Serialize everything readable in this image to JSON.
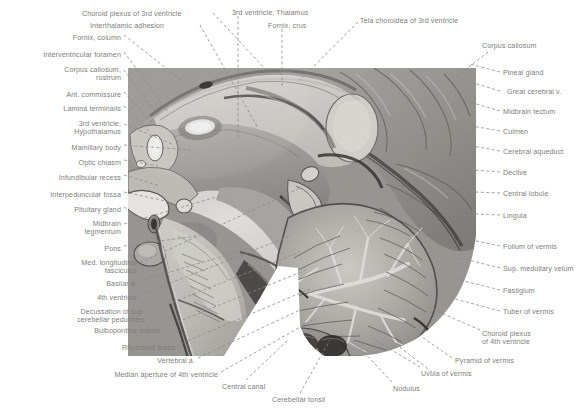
{
  "figure": {
    "text_color": "#7d7d7d",
    "leader_color": "#8a8a8a",
    "background": "#ffffff",
    "width": 587,
    "height": 411
  },
  "labels_top": [
    {
      "text": "Choroid plexus of 3rd ventricle",
      "x": 82,
      "y": 10,
      "align": "l",
      "lines": [
        "Choroid plexus of 3rd ventricle"
      ]
    },
    {
      "text": "Interthalamic adhesion",
      "x": 90,
      "y": 22,
      "align": "l",
      "lines": [
        "Interthalamic adhesion"
      ]
    },
    {
      "text": "3rd ventricle; Thalamus",
      "x": 232,
      "y": 9,
      "align": "l",
      "lines": [
        "3rd ventricle; Thalamus"
      ]
    },
    {
      "text": "Fornix, crus",
      "x": 268,
      "y": 22,
      "align": "l",
      "lines": [
        "Fornix, crus"
      ]
    },
    {
      "text": "Tela choroidea of 3rd ventricle",
      "x": 360,
      "y": 17,
      "align": "l",
      "lines": [
        "Tela choroidea of 3rd ventricle"
      ]
    }
  ],
  "labels_left": [
    {
      "text": "Fornix, column",
      "x": 121,
      "y": 34,
      "align": "r",
      "lines": [
        "Fornix, column"
      ]
    },
    {
      "text": "Interventricular foramen",
      "x": 121,
      "y": 51,
      "align": "r",
      "lines": [
        "Interventricular foramen"
      ]
    },
    {
      "text": "Corpus callosum, rostrum",
      "x": 121,
      "y": 66,
      "align": "r",
      "lines": [
        "Corpus callosum,",
        "rostrum"
      ]
    },
    {
      "text": "Ant. commissure",
      "x": 121,
      "y": 91,
      "align": "r",
      "lines": [
        "Ant. commissure"
      ]
    },
    {
      "text": "Lamina terminalis",
      "x": 121,
      "y": 105,
      "align": "r",
      "lines": [
        "Lamina terminalis"
      ]
    },
    {
      "text": "3rd ventricle; Hypothalamus",
      "x": 121,
      "y": 120,
      "align": "r",
      "lines": [
        "3rd ventricle;",
        "Hypothalamus"
      ]
    },
    {
      "text": "Mamillary body",
      "x": 121,
      "y": 144,
      "align": "r",
      "lines": [
        "Mamillary body"
      ]
    },
    {
      "text": "Optic chiasm",
      "x": 121,
      "y": 159,
      "align": "r",
      "lines": [
        "Optic chiasm"
      ]
    },
    {
      "text": "Infundibular recess",
      "x": 121,
      "y": 174,
      "align": "r",
      "lines": [
        "Infundibular recess"
      ]
    },
    {
      "text": "Interpeduncular fossa",
      "x": 121,
      "y": 191,
      "align": "r",
      "lines": [
        "Interpeduncular fossa"
      ]
    },
    {
      "text": "Pituitary gland",
      "x": 121,
      "y": 206,
      "align": "r",
      "lines": [
        "Pituitary gland"
      ]
    },
    {
      "text": "Midbrain tegmentum",
      "x": 121,
      "y": 220,
      "align": "r",
      "lines": [
        "Midbrain",
        "tegmentum"
      ]
    },
    {
      "text": "Pons",
      "x": 121,
      "y": 245,
      "align": "r",
      "lines": [
        "Pons"
      ]
    },
    {
      "text": "Med. longitudinal fasciculus",
      "x": 137,
      "y": 259,
      "align": "r",
      "lines": [
        "Med. longitudinal",
        "fasciculus"
      ]
    },
    {
      "text": "Basilar a.",
      "x": 137,
      "y": 280,
      "align": "r",
      "lines": [
        "Basilar a."
      ]
    },
    {
      "text": "4th ventricle",
      "x": 137,
      "y": 294,
      "align": "r",
      "lines": [
        "4th ventricle"
      ]
    },
    {
      "text": "Decussation of sup. cerebellar peduncles",
      "x": 145,
      "y": 308,
      "align": "r",
      "lines": [
        "Decussation of sup.",
        "cerebellar peduncles"
      ]
    },
    {
      "text": "Bulbopontine sulcus",
      "x": 160,
      "y": 327,
      "align": "r",
      "lines": [
        "Bulbopontine sulcus"
      ]
    },
    {
      "text": "Rhomboid fossa",
      "x": 175,
      "y": 344,
      "align": "r",
      "lines": [
        "Rhomboid fossa"
      ]
    },
    {
      "text": "Vertebral a.",
      "x": 195,
      "y": 357,
      "align": "r",
      "lines": [
        "Vertebral a."
      ]
    },
    {
      "text": "Median aperture of 4th ventricle",
      "x": 218,
      "y": 371,
      "align": "r",
      "lines": [
        "Median aperture of 4th ventricle"
      ]
    }
  ],
  "labels_bottom": [
    {
      "text": "Central canal",
      "x": 222,
      "y": 383,
      "align": "l",
      "lines": [
        "Central canal"
      ]
    },
    {
      "text": "Cerebellar tonsil",
      "x": 272,
      "y": 396,
      "align": "l",
      "lines": [
        "Cerebellar tonsil"
      ]
    },
    {
      "text": "Nodulus",
      "x": 393,
      "y": 385,
      "align": "l",
      "lines": [
        "Nodulus"
      ]
    },
    {
      "text": "Uvula of vermis",
      "x": 421,
      "y": 370,
      "align": "l",
      "lines": [
        "Uvula of vermis"
      ]
    }
  ],
  "labels_right": [
    {
      "text": "Corpus callosum",
      "x": 482,
      "y": 42,
      "align": "l",
      "lines": [
        "Corpus callosum"
      ]
    },
    {
      "text": "Pineal gland",
      "x": 503,
      "y": 69,
      "align": "l",
      "lines": [
        "Pineal gland"
      ]
    },
    {
      "text": "Great cerebral v.",
      "x": 507,
      "y": 88,
      "align": "l",
      "lines": [
        "Great cerebral v."
      ]
    },
    {
      "text": "Midbrain tectum",
      "x": 503,
      "y": 108,
      "align": "l",
      "lines": [
        "Midbrain tectum"
      ]
    },
    {
      "text": "Culmen",
      "x": 503,
      "y": 128,
      "align": "l",
      "lines": [
        "Culmen"
      ]
    },
    {
      "text": "Cerebral aqueduct",
      "x": 503,
      "y": 148,
      "align": "l",
      "lines": [
        "Cerebral aqueduct"
      ]
    },
    {
      "text": "Declive",
      "x": 503,
      "y": 169,
      "align": "l",
      "lines": [
        "Declive"
      ]
    },
    {
      "text": "Central lobule",
      "x": 503,
      "y": 190,
      "align": "l",
      "lines": [
        "Central lobule"
      ]
    },
    {
      "text": "Lingula",
      "x": 503,
      "y": 212,
      "align": "l",
      "lines": [
        "Lingula"
      ]
    },
    {
      "text": "Folium of vermis",
      "x": 503,
      "y": 243,
      "align": "l",
      "lines": [
        "Folium of vermis"
      ]
    },
    {
      "text": "Sup. medullary velum",
      "x": 503,
      "y": 265,
      "align": "l",
      "lines": [
        "Sup. medullary velum"
      ]
    },
    {
      "text": "Fastigium",
      "x": 503,
      "y": 287,
      "align": "l",
      "lines": [
        "Fastigium"
      ]
    },
    {
      "text": "Tuber of vermis",
      "x": 503,
      "y": 308,
      "align": "l",
      "lines": [
        "Tuber of vermis"
      ]
    },
    {
      "text": "Choroid plexus of 4th ventricle",
      "x": 482,
      "y": 330,
      "align": "l",
      "lines": [
        "Choroid plexus",
        "of 4th ventricle"
      ]
    },
    {
      "text": "Pyramid of vermis",
      "x": 455,
      "y": 357,
      "align": "l",
      "lines": [
        "Pyramid of vermis"
      ]
    }
  ]
}
